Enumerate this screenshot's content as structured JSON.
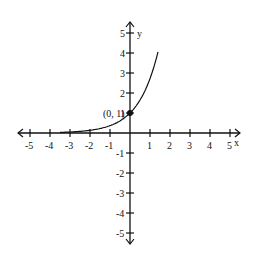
{
  "chart_data": {
    "type": "line",
    "title": "",
    "xlabel": "x",
    "ylabel": "y",
    "xlim": [
      -5,
      5
    ],
    "ylim": [
      -5,
      5
    ],
    "grid": false,
    "x_ticks": [
      -5,
      -4,
      -3,
      -2,
      -1,
      1,
      2,
      3,
      4,
      5
    ],
    "y_ticks": [
      5,
      4,
      3,
      2,
      1,
      -1,
      -2,
      -3,
      -4,
      -5
    ],
    "series": [
      {
        "name": "exponential curve",
        "x": [
          -3.5,
          -3,
          -2,
          -1,
          0,
          0.5,
          1,
          1.4
        ],
        "y": [
          0.03,
          0.05,
          0.14,
          0.37,
          1,
          1.65,
          2.72,
          4.9
        ]
      }
    ],
    "annotations": [
      {
        "text": "(0, 1)",
        "x": 0,
        "y": 1,
        "marker": "filled-dot"
      }
    ]
  }
}
